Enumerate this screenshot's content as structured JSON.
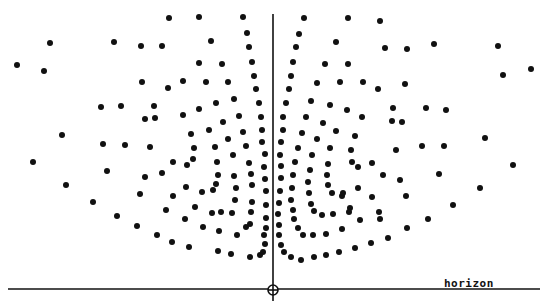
{
  "diagram": {
    "width": 553,
    "height": 301,
    "ink_color": "#111111",
    "background": "#ffffff",
    "dot_radius": 3,
    "vertical_axis": {
      "x": 273,
      "y1": 14,
      "y2": 301
    },
    "horizon": {
      "y": 289,
      "x1": 8,
      "x2": 540,
      "label": "horizon",
      "label_x": 444,
      "label_y": 277
    },
    "origin_marker": {
      "cx": 273,
      "cy": 290,
      "r": 5
    },
    "dots": [
      [
        17,
        65
      ],
      [
        50,
        43
      ],
      [
        44,
        71
      ],
      [
        114,
        42
      ],
      [
        101,
        107
      ],
      [
        121,
        106
      ],
      [
        62,
        135
      ],
      [
        103,
        144
      ],
      [
        125,
        145
      ],
      [
        169,
        18
      ],
      [
        199,
        17
      ],
      [
        243,
        17
      ],
      [
        141,
        46
      ],
      [
        162,
        46
      ],
      [
        211,
        41
      ],
      [
        247,
        33
      ],
      [
        249,
        47
      ],
      [
        199,
        63
      ],
      [
        222,
        64
      ],
      [
        252,
        62
      ],
      [
        142,
        82
      ],
      [
        168,
        88
      ],
      [
        183,
        81
      ],
      [
        206,
        82
      ],
      [
        228,
        82
      ],
      [
        254,
        76
      ],
      [
        256,
        89
      ],
      [
        154,
        106
      ],
      [
        145,
        119
      ],
      [
        155,
        118
      ],
      [
        183,
        115
      ],
      [
        199,
        109
      ],
      [
        216,
        103
      ],
      [
        234,
        99
      ],
      [
        259,
        103
      ],
      [
        239,
        116
      ],
      [
        261,
        117
      ],
      [
        191,
        134
      ],
      [
        209,
        130
      ],
      [
        223,
        122
      ],
      [
        243,
        132
      ],
      [
        262,
        130
      ],
      [
        150,
        147
      ],
      [
        194,
        148
      ],
      [
        215,
        147
      ],
      [
        228,
        139
      ],
      [
        246,
        146
      ],
      [
        262,
        142
      ],
      [
        304,
        18
      ],
      [
        348,
        18
      ],
      [
        380,
        21
      ],
      [
        299,
        34
      ],
      [
        296,
        47
      ],
      [
        336,
        42
      ],
      [
        385,
        48
      ],
      [
        407,
        49
      ],
      [
        434,
        44
      ],
      [
        498,
        46
      ],
      [
        293,
        62
      ],
      [
        325,
        64
      ],
      [
        348,
        64
      ],
      [
        503,
        75
      ],
      [
        531,
        69
      ],
      [
        291,
        76
      ],
      [
        317,
        83
      ],
      [
        340,
        82
      ],
      [
        363,
        82
      ],
      [
        378,
        89
      ],
      [
        405,
        84
      ],
      [
        289,
        89
      ],
      [
        286,
        103
      ],
      [
        311,
        101
      ],
      [
        330,
        105
      ],
      [
        347,
        110
      ],
      [
        393,
        108
      ],
      [
        426,
        108
      ],
      [
        446,
        110
      ],
      [
        283,
        117
      ],
      [
        306,
        117
      ],
      [
        323,
        123
      ],
      [
        362,
        117
      ],
      [
        392,
        121
      ],
      [
        402,
        122
      ],
      [
        283,
        130
      ],
      [
        302,
        133
      ],
      [
        336,
        131
      ],
      [
        355,
        136
      ],
      [
        281,
        142
      ],
      [
        317,
        139
      ],
      [
        298,
        148
      ],
      [
        330,
        148
      ],
      [
        351,
        150
      ],
      [
        396,
        150
      ],
      [
        422,
        146
      ],
      [
        444,
        146
      ],
      [
        485,
        138
      ],
      [
        33,
        162
      ],
      [
        66,
        185
      ],
      [
        107,
        171
      ],
      [
        93,
        202
      ],
      [
        117,
        216
      ],
      [
        137,
        226
      ],
      [
        173,
        162
      ],
      [
        187,
        165
      ],
      [
        193,
        159
      ],
      [
        145,
        177
      ],
      [
        162,
        173
      ],
      [
        140,
        194
      ],
      [
        173,
        196
      ],
      [
        186,
        187
      ],
      [
        202,
        192
      ],
      [
        166,
        210
      ],
      [
        195,
        207
      ],
      [
        185,
        219
      ],
      [
        233,
        155
      ],
      [
        265,
        154
      ],
      [
        217,
        162
      ],
      [
        249,
        163
      ],
      [
        264,
        167
      ],
      [
        218,
        175
      ],
      [
        234,
        176
      ],
      [
        251,
        174
      ],
      [
        265,
        179
      ],
      [
        216,
        184
      ],
      [
        213,
        190
      ],
      [
        236,
        188
      ],
      [
        252,
        185
      ],
      [
        266,
        191
      ],
      [
        235,
        200
      ],
      [
        252,
        202
      ],
      [
        266,
        205
      ],
      [
        232,
        213
      ],
      [
        221,
        212
      ],
      [
        212,
        213
      ],
      [
        251,
        212
      ],
      [
        266,
        218
      ],
      [
        157,
        235
      ],
      [
        172,
        242
      ],
      [
        189,
        247
      ],
      [
        203,
        227
      ],
      [
        218,
        251
      ],
      [
        219,
        231
      ],
      [
        231,
        254
      ],
      [
        237,
        235
      ],
      [
        246,
        227
      ],
      [
        250,
        224
      ],
      [
        250,
        257
      ],
      [
        260,
        255
      ],
      [
        263,
        252
      ],
      [
        265,
        244
      ],
      [
        264,
        235
      ],
      [
        266,
        228
      ],
      [
        280,
        155
      ],
      [
        312,
        155
      ],
      [
        295,
        162
      ],
      [
        281,
        166
      ],
      [
        328,
        164
      ],
      [
        310,
        170
      ],
      [
        281,
        178
      ],
      [
        293,
        175
      ],
      [
        327,
        175
      ],
      [
        308,
        182
      ],
      [
        280,
        191
      ],
      [
        292,
        188
      ],
      [
        328,
        185
      ],
      [
        332,
        193
      ],
      [
        342,
        196
      ],
      [
        279,
        203
      ],
      [
        309,
        193
      ],
      [
        291,
        200
      ],
      [
        311,
        204
      ],
      [
        352,
        162
      ],
      [
        358,
        167
      ],
      [
        372,
        163
      ],
      [
        383,
        175
      ],
      [
        400,
        180
      ],
      [
        343,
        193
      ],
      [
        358,
        188
      ],
      [
        372,
        197
      ],
      [
        406,
        196
      ],
      [
        350,
        208
      ],
      [
        379,
        212
      ],
      [
        360,
        220
      ],
      [
        513,
        165
      ],
      [
        439,
        174
      ],
      [
        480,
        188
      ],
      [
        453,
        205
      ],
      [
        428,
        219
      ],
      [
        407,
        228
      ],
      [
        278,
        214
      ],
      [
        293,
        210
      ],
      [
        314,
        211
      ],
      [
        322,
        215
      ],
      [
        333,
        214
      ],
      [
        349,
        212
      ],
      [
        279,
        225
      ],
      [
        294,
        219
      ],
      [
        298,
        228
      ],
      [
        303,
        235
      ],
      [
        313,
        235
      ],
      [
        326,
        234
      ],
      [
        342,
        229
      ],
      [
        380,
        219
      ],
      [
        279,
        235
      ],
      [
        281,
        245
      ],
      [
        284,
        252
      ],
      [
        291,
        257
      ],
      [
        301,
        260
      ],
      [
        314,
        257
      ],
      [
        326,
        255
      ],
      [
        339,
        252
      ],
      [
        355,
        248
      ],
      [
        371,
        243
      ],
      [
        388,
        238
      ]
    ]
  }
}
